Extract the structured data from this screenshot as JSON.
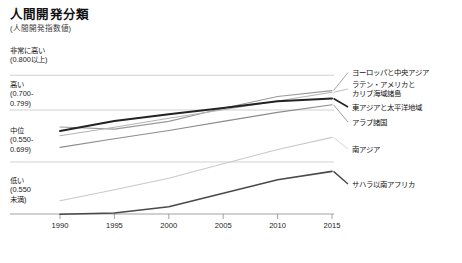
{
  "header": {
    "title": "人間開発分類",
    "subtitle": "(人間開発指数値)"
  },
  "categories_axis": [
    {
      "name": "非常に高い",
      "range": "(0.800以上)"
    },
    {
      "name": "高い",
      "range": "(0.700-\n0.799)"
    },
    {
      "name": "中位",
      "range": "(0.550-\n0.699)"
    },
    {
      "name": "低い",
      "range": "(0.550\n未満)"
    }
  ],
  "x_axis": {
    "ticks": [
      "1990",
      "1995",
      "2000",
      "2005",
      "2010",
      "2015"
    ]
  },
  "legend": [
    {
      "label": "ヨーロッパと中央アジア",
      "color": "#9a9a9a"
    },
    {
      "label": "ラテン・アメリカと\nカリブ海域諸島",
      "color": "#b4b4b4"
    },
    {
      "label": "東アジアと太平洋地域",
      "color": "#232323"
    },
    {
      "label": "アラブ諸国",
      "color": "#8d8d8d"
    },
    {
      "label": "南アジア",
      "color": "#c9c9c9"
    },
    {
      "label": "サハラ以南アフリカ",
      "color": "#4a4a4a"
    }
  ],
  "chart_data": {
    "type": "line",
    "title": "人間開発分類",
    "subtitle": "(人間開発指数値)",
    "xlabel": "",
    "ylabel": "人間開発指数値",
    "x": [
      1990,
      1995,
      2000,
      2005,
      2010,
      2015
    ],
    "xlim": [
      1990,
      2015
    ],
    "ylim": [
      0.4,
      0.85
    ],
    "grid": true,
    "gridlines": [
      0.8,
      0.7,
      0.55
    ],
    "legend_position": "right",
    "y_category_bands": [
      {
        "label": "非常に高い",
        "range_text": "(0.800以上)",
        "min": 0.8,
        "max": 1.0
      },
      {
        "label": "高い",
        "range_text": "(0.700-0.799)",
        "min": 0.7,
        "max": 0.799
      },
      {
        "label": "中位",
        "range_text": "(0.550-0.699)",
        "min": 0.55,
        "max": 0.699
      },
      {
        "label": "低い",
        "range_text": "(0.550未満)",
        "min": 0.0,
        "max": 0.549
      }
    ],
    "series": [
      {
        "name": "ヨーロッパと中央アジア",
        "color": "#9a9a9a",
        "width": 1.1,
        "values": [
          0.651,
          0.645,
          0.667,
          0.705,
          0.739,
          0.756
        ]
      },
      {
        "name": "ラテン・アメリカとカリブ海域諸島",
        "color": "#b4b4b4",
        "width": 1.1,
        "values": [
          0.626,
          0.65,
          0.676,
          0.701,
          0.726,
          0.751
        ]
      },
      {
        "name": "東アジアと太平洋地域",
        "color": "#232323",
        "width": 2.0,
        "values": [
          0.639,
          0.668,
          0.688,
          0.706,
          0.725,
          0.733
        ]
      },
      {
        "name": "アラブ諸国",
        "color": "#8d8d8d",
        "width": 1.1,
        "values": [
          0.592,
          0.617,
          0.641,
          0.667,
          0.693,
          0.715
        ]
      },
      {
        "name": "南アジア",
        "color": "#c9c9c9",
        "width": 1.1,
        "values": [
          0.438,
          0.47,
          0.503,
          0.545,
          0.586,
          0.621
        ]
      },
      {
        "name": "サハラ以南アフリカ",
        "color": "#4a4a4a",
        "width": 1.6,
        "values": [
          0.399,
          0.403,
          0.421,
          0.46,
          0.499,
          0.523
        ]
      }
    ]
  }
}
